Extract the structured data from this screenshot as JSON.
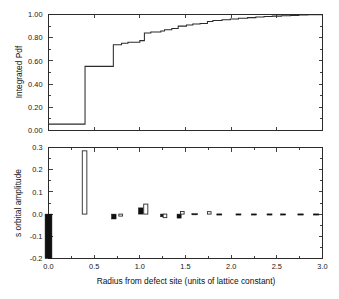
{
  "figure": {
    "panels": [
      {
        "id": "top-panel",
        "ylabel": "Integrated Pdf",
        "yticks": [
          "0.00",
          "0.20",
          "0.40",
          "0.60",
          "0.80",
          "1.00"
        ],
        "ylim": [
          0.0,
          1.0
        ],
        "xlim": [
          0.0,
          3.0
        ],
        "xticks_shown": false
      },
      {
        "id": "bottom-panel",
        "ylabel": "s orbital amplitude",
        "xlabel": "Radius from defect site (units of lattice constant)",
        "yticks": [
          "0.3",
          "0.2",
          "0.1",
          "0.0",
          "-0.1",
          "-0.2"
        ],
        "xticks": [
          "0.0",
          "0.5",
          "1.0",
          "1.5",
          "2.0",
          "2.5",
          "3.0"
        ],
        "ylim": [
          -0.2,
          0.3
        ],
        "xlim": [
          0.0,
          3.0
        ]
      }
    ]
  },
  "chart_data": [
    {
      "type": "line",
      "id": "integrated-pdf-step",
      "title": "",
      "xlabel": "Radius from defect site (units of lattice constant)",
      "ylabel": "Integrated Pdf",
      "xlim": [
        0.0,
        3.0
      ],
      "ylim": [
        0.0,
        1.0
      ],
      "grid": false,
      "legend": "none",
      "drawstyle": "steps-post",
      "x": [
        0.0,
        0.4,
        0.71,
        0.8,
        0.87,
        1.0,
        1.05,
        1.12,
        1.23,
        1.27,
        1.35,
        1.42,
        1.51,
        1.58,
        1.66,
        1.74,
        1.8,
        1.9,
        1.99,
        2.08,
        2.18,
        2.27,
        2.36,
        2.45,
        2.55,
        2.65,
        2.74,
        2.84,
        2.92,
        3.0
      ],
      "y": [
        0.055,
        0.553,
        0.74,
        0.752,
        0.76,
        0.775,
        0.84,
        0.85,
        0.858,
        0.868,
        0.88,
        0.9,
        0.91,
        0.918,
        0.922,
        0.94,
        0.948,
        0.955,
        0.962,
        0.968,
        0.973,
        0.978,
        0.982,
        0.986,
        0.989,
        0.992,
        0.995,
        0.997,
        0.999,
        1.0
      ]
    },
    {
      "type": "bar",
      "id": "s-orbital-amplitude",
      "title": "",
      "xlabel": "Radius from defect site (units of lattice constant)",
      "ylabel": "s orbital amplitude",
      "xlim": [
        0.0,
        3.0
      ],
      "ylim": [
        -0.2,
        0.3
      ],
      "grid": false,
      "legend": "none",
      "series": [
        {
          "name": "filled",
          "style": "solid-black",
          "points": [
            {
              "x": 0.0,
              "y": -0.2,
              "w": 0.075
            },
            {
              "x": 0.715,
              "y": -0.022,
              "w": 0.05
            },
            {
              "x": 1.01,
              "y": 0.028,
              "w": 0.05
            },
            {
              "x": 1.25,
              "y": -0.012,
              "w": 0.045
            },
            {
              "x": 1.43,
              "y": -0.018,
              "w": 0.045
            },
            {
              "x": 1.6,
              "y": 0.002,
              "w": 0.06
            },
            {
              "x": 1.87,
              "y": 0.001,
              "w": 0.055
            },
            {
              "x": 2.08,
              "y": 0.001,
              "w": 0.055
            },
            {
              "x": 2.25,
              "y": 0.001,
              "w": 0.055
            },
            {
              "x": 2.42,
              "y": 0.001,
              "w": 0.055
            },
            {
              "x": 2.57,
              "y": 0.001,
              "w": 0.055
            },
            {
              "x": 2.76,
              "y": 0.001,
              "w": 0.06
            },
            {
              "x": 2.93,
              "y": 0.001,
              "w": 0.06
            }
          ]
        },
        {
          "name": "open",
          "style": "open-white",
          "points": [
            {
              "x": 0.395,
              "y": 0.285,
              "w": 0.05
            },
            {
              "x": 0.79,
              "y": -0.009,
              "w": 0.04
            },
            {
              "x": 1.065,
              "y": 0.045,
              "w": 0.045
            },
            {
              "x": 1.275,
              "y": -0.016,
              "w": 0.04
            },
            {
              "x": 1.465,
              "y": 0.012,
              "w": 0.04
            },
            {
              "x": 1.76,
              "y": 0.011,
              "w": 0.04
            }
          ]
        }
      ]
    }
  ]
}
